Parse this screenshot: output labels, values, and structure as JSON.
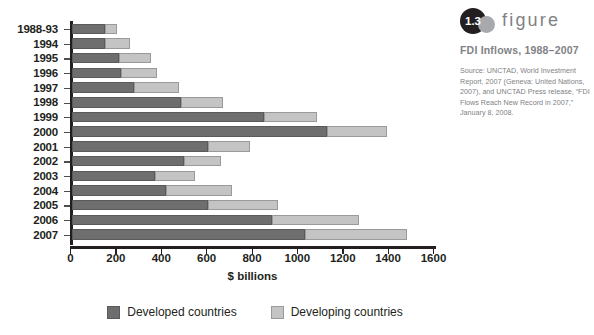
{
  "figure": {
    "number": "1.3",
    "word": "figure",
    "title": "FDI Inflows, 1988–2007",
    "source": "Source: UNCTAD, World Investment Report, 2007 (Geneva: United Nations, 2007), and UNCTAD Press release, “FDI Flows Reach New Record in 2007,” January 8, 2008."
  },
  "legend": {
    "items": [
      {
        "label": "Developed countries",
        "color": "#6e6e6e"
      },
      {
        "label": "Developing countries",
        "color": "#c4c4c4"
      }
    ]
  },
  "axis": {
    "x_title": "$ billions",
    "x_ticks": [
      "0",
      "200",
      "400",
      "600",
      "800",
      "1000",
      "1200",
      "1400",
      "1600"
    ]
  },
  "chart_data": {
    "type": "bar",
    "orientation": "horizontal",
    "stacked": true,
    "title": "FDI Inflows, 1988–2007",
    "xlabel": "$ billions",
    "ylabel": "",
    "xlim": [
      0,
      1600
    ],
    "xticks": [
      0,
      200,
      400,
      600,
      800,
      1000,
      1200,
      1400,
      1600
    ],
    "grid": false,
    "legend_position": "bottom",
    "categories": [
      "1988-93",
      "1994",
      "1995",
      "1996",
      "1997",
      "1998",
      "1999",
      "2000",
      "2001",
      "2002",
      "2003",
      "2004",
      "2005",
      "2006",
      "2007"
    ],
    "series": [
      {
        "name": "Developed countries",
        "color": "#6e6e6e",
        "values": [
          145,
          145,
          205,
          215,
          275,
          480,
          845,
          1125,
          600,
          495,
          365,
          415,
          600,
          880,
          1025
        ]
      },
      {
        "name": "Developing countries",
        "color": "#c4c4c4",
        "values": [
          55,
          110,
          145,
          160,
          195,
          185,
          235,
          265,
          185,
          160,
          175,
          290,
          310,
          385,
          450
        ]
      }
    ],
    "totals": [
      200,
      255,
      350,
      375,
      470,
      665,
      1080,
      1390,
      785,
      655,
      540,
      705,
      910,
      1265,
      1475
    ]
  }
}
